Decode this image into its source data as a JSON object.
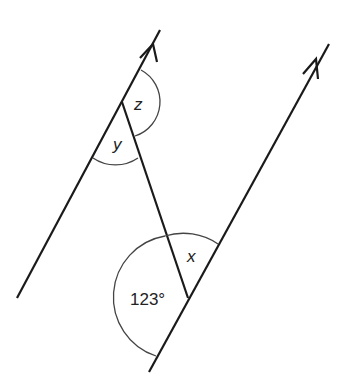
{
  "diagram": {
    "type": "parallel-lines-angles",
    "labels": {
      "z": "z",
      "y": "y",
      "x": "x",
      "angle_given": "123°"
    },
    "colors": {
      "line": "#1a1a1a",
      "arc": "#444444",
      "background": "#ffffff"
    }
  }
}
